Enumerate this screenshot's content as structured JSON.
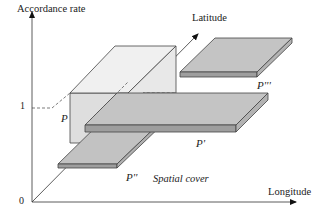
{
  "diagram": {
    "axes": {
      "y_label": "Accordance rate",
      "x_label": "Longitude",
      "z_label": "Latitude",
      "origin_label": "0",
      "one_label": "1"
    },
    "patches": [
      {
        "id": "P",
        "label": "P",
        "description": "tall block with accordance rate 1"
      },
      {
        "id": "P1",
        "label": "P'",
        "description": "thin slab in middle"
      },
      {
        "id": "P2",
        "label": "P''",
        "description": "thin slab in front"
      },
      {
        "id": "P3",
        "label": "P'''",
        "description": "thin slab far right"
      }
    ],
    "annotation": "Spatial cover",
    "colors": {
      "line": "#333333",
      "block_top": "#eeeeee",
      "block_front": "#dddddd",
      "slab_top": "#bdbdbd",
      "slab_edge": "#9a9a9a"
    }
  }
}
